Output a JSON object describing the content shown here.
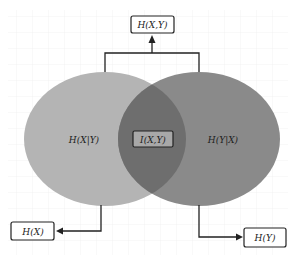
{
  "diagram": {
    "type": "venn",
    "labels": {
      "joint": "H(X,Y)",
      "cond_x_given_y": "H(X|Y)",
      "mutual": "I(X,Y)",
      "cond_y_given_x": "H(Y|X)",
      "entropy_x": "H(X)",
      "entropy_y": "H(Y)"
    },
    "colors": {
      "left_ellipse": "#b4b4b4",
      "right_ellipse": "#8a8a8a",
      "overlap": "#6e6e6e",
      "grid": "#ececec",
      "stroke": "#222222",
      "mutual_box_fill": "#a8a8a8"
    }
  }
}
